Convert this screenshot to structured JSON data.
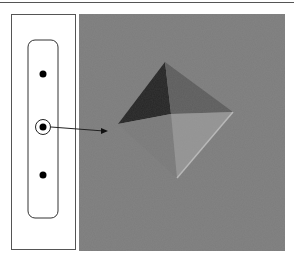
{
  "figure": {
    "specimen": {
      "indent_points": 3,
      "highlighted_point_index": 1,
      "dot_color": "#000000"
    },
    "micrograph": {
      "magnification_label": "Lens:×2000",
      "background_color": "#7f7f7f",
      "feature": "pyramidal-indentation"
    }
  }
}
